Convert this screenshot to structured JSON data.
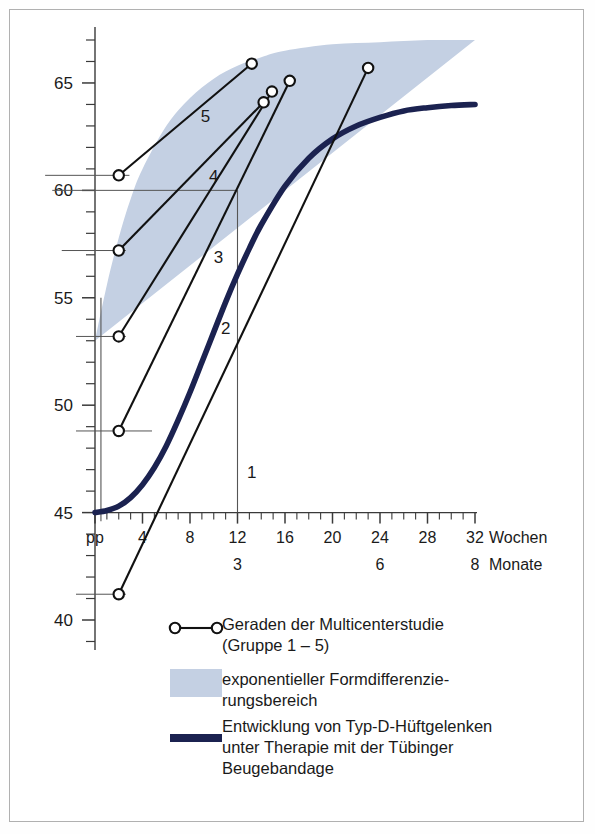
{
  "chart_data": {
    "type": "line",
    "title": "",
    "xlabel_weeks": "Wochen",
    "xlabel_months": "Monate",
    "ylabel": "",
    "xlim_weeks": [
      0,
      32
    ],
    "ylim": [
      40,
      67
    ],
    "grid": false,
    "y_ticks_labeled": [
      40,
      45,
      50,
      55,
      60,
      65
    ],
    "y_tick_step_minor": 1,
    "x_ticks_weeks": [
      0,
      4,
      8,
      12,
      16,
      20,
      24,
      28,
      32
    ],
    "x_tick_labels": [
      "pp",
      "4",
      "8",
      "12",
      "16",
      "20",
      "24",
      "28",
      "32"
    ],
    "x_tick_step_minor": 1,
    "x_month_ticks": [
      {
        "weeks": 12,
        "label": "3"
      },
      {
        "weeks": 24,
        "label": "6"
      },
      {
        "weeks": 32,
        "label": "8"
      }
    ],
    "series": [
      {
        "name": "1",
        "label": "1",
        "type": "segment",
        "x": [
          2.0,
          23.0
        ],
        "y": [
          41.2,
          65.7
        ],
        "label_x": 13.2,
        "label_y": 46.6,
        "markers": "open-circle-both-ends"
      },
      {
        "name": "2",
        "label": "2",
        "type": "segment",
        "x": [
          2.0,
          16.4
        ],
        "y": [
          48.8,
          65.1
        ],
        "label_x": 11.0,
        "label_y": 53.3,
        "markers": "open-circle-both-ends"
      },
      {
        "name": "3",
        "label": "3",
        "type": "segment",
        "x": [
          2.0,
          14.9
        ],
        "y": [
          53.2,
          64.6
        ],
        "label_x": 10.4,
        "label_y": 56.6,
        "markers": "open-circle-both-ends"
      },
      {
        "name": "4",
        "label": "4",
        "type": "segment",
        "x": [
          2.0,
          14.2
        ],
        "y": [
          57.2,
          64.1
        ],
        "label_x": 10.0,
        "label_y": 60.4,
        "markers": "open-circle-both-ends"
      },
      {
        "name": "5",
        "label": "5",
        "type": "segment",
        "x": [
          2.0,
          13.2
        ],
        "y": [
          60.7,
          65.9
        ],
        "label_x": 9.3,
        "label_y": 63.2,
        "markers": "open-circle-both-ends"
      }
    ],
    "band": {
      "name": "exponentieller Formdifferenzierungsbereich",
      "color": "#c4d0e3",
      "x_weeks": [
        0,
        1,
        2,
        3,
        4,
        6,
        8,
        10,
        12,
        14,
        16,
        20,
        24,
        28,
        32
      ],
      "y_upper": [
        53.0,
        55.6,
        57.8,
        59.6,
        61.0,
        63.0,
        64.3,
        65.2,
        65.8,
        66.2,
        66.5,
        66.8,
        66.9,
        67.0,
        67.0
      ],
      "y_lower": [
        45.0,
        46.8,
        48.6,
        50.3,
        51.9,
        54.6,
        56.8,
        58.6,
        60.1,
        61.2,
        62.1,
        63.2,
        63.7,
        63.9,
        64.0
      ]
    },
    "therapy_curve": {
      "name": "Entwicklung von Typ-D-Hüftgelenken unter Therapie mit der Tübinger Beugebandage",
      "color": "#1b2250",
      "x_weeks": [
        0,
        1,
        2,
        3,
        4,
        5,
        6,
        7,
        8,
        9,
        10,
        11,
        12,
        13,
        14,
        16,
        18,
        20,
        22,
        24,
        26,
        28,
        30,
        32
      ],
      "y": [
        45.0,
        45.1,
        45.3,
        45.7,
        46.3,
        47.1,
        48.1,
        49.3,
        50.6,
        52.0,
        53.4,
        54.8,
        56.1,
        57.3,
        58.4,
        60.2,
        61.5,
        62.4,
        63.0,
        63.4,
        63.7,
        63.85,
        63.95,
        64.0
      ]
    },
    "reference_lines": {
      "vertical": [
        {
          "at_weeks": 12,
          "from_y": 45.0,
          "to_y": 60.0
        },
        {
          "at_weeks": 0.5,
          "from_y": 44.6,
          "to_y": 55.0
        }
      ],
      "horizontal_leaders": [
        {
          "y": 41.2,
          "from_weeks": -1.6,
          "to_weeks": 2.6
        },
        {
          "y": 48.8,
          "from_weeks": -1.6,
          "to_weeks": 4.8
        },
        {
          "y": 53.2,
          "from_weeks": -1.6,
          "to_weeks": 2.6
        },
        {
          "y": 57.2,
          "from_weeks": -2.8,
          "to_weeks": 2.6
        },
        {
          "y": 60.0,
          "from_weeks": -3.6,
          "to_weeks": 12.0
        },
        {
          "y": 60.7,
          "from_weeks": -4.2,
          "to_weeks": 2.9
        }
      ]
    }
  },
  "legend": {
    "items": [
      {
        "key": "multicenter",
        "marker": "line-with-open-circles",
        "lines": [
          "Geraden der Multicenterstudie",
          "(Gruppe 1 – 5)"
        ]
      },
      {
        "key": "band",
        "marker": "shaded-swatch",
        "color": "#c4d0e3",
        "lines": [
          "exponentieller Formdifferenzie-",
          "rungsbereich"
        ]
      },
      {
        "key": "therapy",
        "marker": "thick-navy-line",
        "color": "#1b2250",
        "lines": [
          "Entwicklung von Typ-D-Hüftgelenken",
          "unter Therapie mit der Tübinger",
          "Beugebandage"
        ]
      }
    ]
  },
  "colors": {
    "band": "#c4d0e3",
    "curve": "#1b2250",
    "axis": "#3a3a3a",
    "frame": "#b0b0b0",
    "text": "#1a1a1a"
  }
}
